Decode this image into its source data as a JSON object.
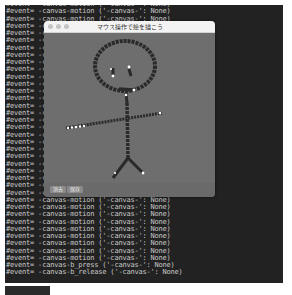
{
  "terminal": {
    "lines": [
      "#event= -canvas-motion ('-canvas-': None)",
      "#event= -canvas-motion ('-canvas-': None)",
      "#event= -canvas-motion ('-canvas-': None)",
      "#event= -canvas-motion ('-canvas-': None)",
      "#event= -canvas-motion ('-canvas-': None)",
      "#event= -canvas-motion ('-canvas-': None)",
      "#event= -canvas-motion ('-canvas-': None)",
      "#event= -canvas-motion ('-canvas-': None)",
      "#event= -canvas-motion ('-canvas-': None)",
      "#event= -canvas-motion ('-canvas-': None)",
      "#event= -canvas-motion ('-canvas-': None)",
      "#event= -canvas-motion ('-canvas-': None)",
      "#event= -canvas-motion ('-canvas-': None)",
      "#event= -canvas-motion ('-canvas-': None)",
      "#event= -canvas-motion ('-canvas-': None)",
      "#event= -canvas-motion ('-canvas-': None)",
      "#event= -canvas-motion ('-canvas-': None)",
      "#event= -canvas-motion ('-canvas-': None)",
      "#event= -canvas-motion ('-canvas-': None)",
      "#event= -canvas-motion ('-canvas-': None)",
      "#event= -canvas-motion ('-canvas-': None)",
      "#event= -canvas-motion ('-canvas-': None)",
      "#event= -canvas-motion ('-canvas-': None)",
      "#event= -canvas-motion ('-canvas-': None)",
      "#event= -canvas-motion ('-canvas-': None)",
      "#event= -canvas-motion ('-canvas-': None)",
      "#event= -canvas-motion ('-canvas-': None)",
      "#event= -canvas-motion ('-canvas-': None)",
      "#event= -canvas-motion ('-canvas-': None)",
      "#event= -canvas-motion ('-canvas-': None)",
      "#event= -canvas-motion ('-canvas-': None)",
      "#event= -canvas-motion ('-canvas-': None)",
      "#event= -canvas-motion ('-canvas-': None)",
      "#event= -canvas-motion ('-canvas-': None)",
      "#event= -canvas-motion ('-canvas-': None)",
      "#event= -canvas-motion ('-canvas-': None)",
      "#event= -canvas-b_press ('-canvas-': None)",
      "#event= -canvas-b_release ('-canvas-': None)"
    ]
  },
  "window": {
    "title": "マウス操作で絵を描こう",
    "buttons": {
      "clear": "消去",
      "save": "保存"
    },
    "colors": {
      "canvas_bg": "#6e6e6e",
      "stroke": "#2a2a2a",
      "dot": "#ffffff"
    }
  },
  "caption": ""
}
